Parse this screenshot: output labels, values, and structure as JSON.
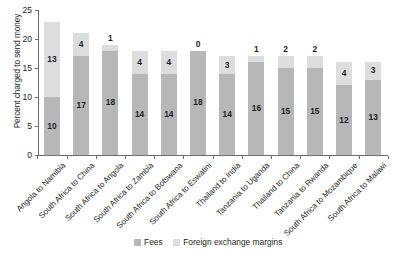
{
  "chart_data": {
    "type": "bar",
    "subtype": "stacked-vertical",
    "title": "",
    "xlabel": "",
    "ylabel": "Percent charged to send money",
    "ylim": [
      0,
      25
    ],
    "yticks": [
      0,
      5,
      10,
      15,
      20,
      25
    ],
    "grid": false,
    "legend_position": "bottom-center",
    "categories": [
      "Angola to Namibia",
      "South Africa to China",
      "South Africa to Angola",
      "South Africa to Zambia",
      "South Africa to Botswana",
      "South Africa to Eswatini",
      "Thailand to India",
      "Tanzania to Uganda",
      "Thailand to China",
      "Tanzania to Rwanda",
      "South Africa to Mozambique",
      "South Africa to Malawi"
    ],
    "series": [
      {
        "name": "Fees",
        "color": "#b6b7b9",
        "values": [
          10,
          17,
          18,
          14,
          14,
          18,
          14,
          16,
          15,
          15,
          12,
          13
        ]
      },
      {
        "name": "Foreign exchange margins",
        "color": "#dcdddf",
        "values": [
          13,
          4,
          1,
          4,
          4,
          0,
          3,
          1,
          2,
          2,
          4,
          3
        ]
      }
    ],
    "totals": [
      23,
      21,
      19,
      18,
      18,
      18,
      17,
      17,
      17,
      17,
      16,
      16
    ]
  },
  "legend": {
    "items": [
      {
        "label": "Fees",
        "color": "#b6b7b9"
      },
      {
        "label": "Foreign exchange margins",
        "color": "#dcdddf"
      }
    ]
  },
  "axis": {
    "y_title": "Percent charged to send money"
  }
}
